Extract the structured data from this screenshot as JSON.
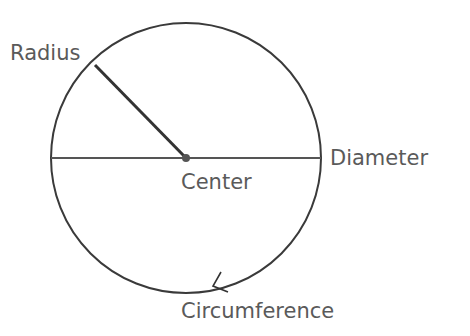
{
  "diagram": {
    "labels": {
      "radius": "Radius",
      "center": "Center",
      "diameter": "Diameter",
      "circumference": "Circumference"
    },
    "colors": {
      "stroke": "#3a3a3a",
      "text": "#5a5a5a",
      "background": "#ffffff"
    }
  }
}
